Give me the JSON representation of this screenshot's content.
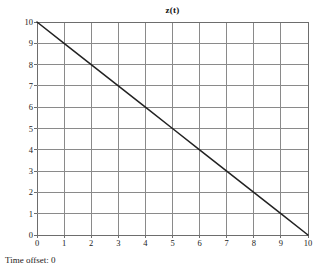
{
  "chart_data": {
    "type": "line",
    "title": "z(t)",
    "xlabel": "",
    "ylabel": "",
    "xlim": [
      0,
      10
    ],
    "ylim": [
      0,
      10
    ],
    "grid": true,
    "legend": "none",
    "xticks": [
      "0",
      "1",
      "2",
      "3",
      "4",
      "5",
      "6",
      "7",
      "8",
      "9",
      "10"
    ],
    "yticks": [
      "0",
      "1",
      "2",
      "3",
      "4",
      "5",
      "6",
      "7",
      "8",
      "9",
      "10"
    ],
    "series": [
      {
        "name": "z(t)",
        "x": [
          0,
          1,
          2,
          3,
          4,
          5,
          6,
          7,
          8,
          9,
          10
        ],
        "values": [
          10,
          9,
          8,
          7,
          6,
          5,
          4,
          3,
          2,
          1,
          0
        ],
        "color": "#222222"
      }
    ]
  },
  "footer": {
    "time_offset_label": "Time offset: 0"
  },
  "colors": {
    "grid": "#8a8a8a",
    "frame": "#6d6d6d",
    "line": "#222222",
    "background": "#ffffff"
  }
}
